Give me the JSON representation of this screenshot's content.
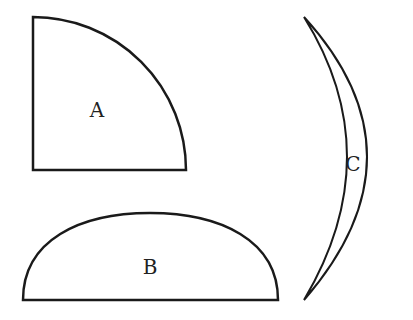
{
  "shapes": [
    {
      "id": "A",
      "label": "A",
      "kind": "quarter-circle"
    },
    {
      "id": "B",
      "label": "B",
      "kind": "semi-ellipse"
    },
    {
      "id": "C",
      "label": "C",
      "kind": "crescent"
    }
  ],
  "colors": {
    "stroke": "#1a1a1a",
    "background": "#ffffff"
  }
}
